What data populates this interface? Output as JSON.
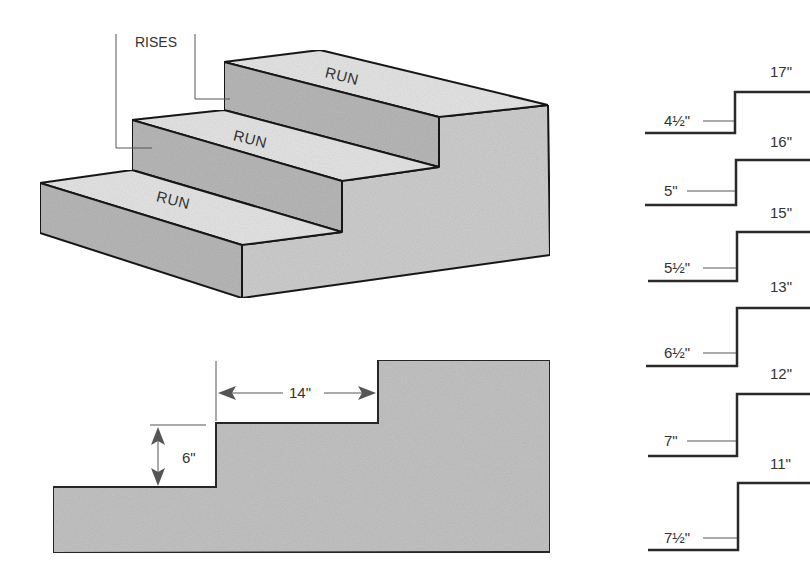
{
  "figure": {
    "isometric_stair": {
      "label_rises": "RISES",
      "treads": [
        {
          "label": "RUN",
          "position": "top"
        },
        {
          "label": "RUN",
          "position": "middle"
        },
        {
          "label": "RUN",
          "position": "bottom"
        }
      ],
      "colors": {
        "riser_fill": "#b9b9b9",
        "tread_fill": "#e6e6e6",
        "side_fill": "#cfcfcf",
        "edge": "#1e1e1e"
      }
    },
    "section_profile": {
      "run_dimension": "14\"",
      "rise_dimension": "6\"",
      "colors": {
        "fill": "#c4c4c4",
        "edge": "#2a2a2a",
        "arrow": "#555555"
      }
    },
    "rise_run_table": {
      "rows": [
        {
          "rise": "4½\"",
          "run": "17\""
        },
        {
          "rise": "5\"",
          "run": "16\""
        },
        {
          "rise": "5½\"",
          "run": "15\""
        },
        {
          "rise": "6½\"",
          "run": "13\""
        },
        {
          "rise": "7\"",
          "run": "12\""
        },
        {
          "rise": "7½\"",
          "run": "11\""
        }
      ]
    }
  }
}
